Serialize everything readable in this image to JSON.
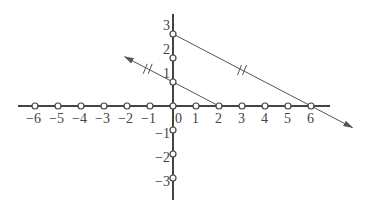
{
  "diagram": {
    "type": "coordinate-plane-parallel-lines",
    "x_axis": {
      "ticks": [
        -6,
        -5,
        -4,
        -3,
        -2,
        -1,
        0,
        1,
        2,
        3,
        4,
        5,
        6
      ],
      "labels": [
        "−6",
        "−5",
        "−4",
        "−3",
        "−2",
        "−1",
        "0",
        "1",
        "2",
        "3",
        "4",
        "5",
        "6"
      ]
    },
    "y_axis": {
      "ticks": [
        3,
        2,
        1,
        -1,
        -2,
        -3
      ],
      "labels": [
        "3",
        "2",
        "1",
        "−1",
        "−2",
        "−3"
      ]
    },
    "lines": [
      {
        "name": "line-through-(0,3)-(6,0)",
        "from": [
          0,
          3
        ],
        "to": [
          6,
          0
        ],
        "arrow": "down-right",
        "tick_mark": "//"
      },
      {
        "name": "line-through-(0,1)-(2,0)",
        "from": [
          0,
          1
        ],
        "to": [
          2,
          0
        ],
        "arrow": "up-left",
        "tick_mark": "//"
      }
    ],
    "colors": {
      "axis": "#444444",
      "line": "#555555",
      "point_fill": "#ffffff"
    }
  }
}
